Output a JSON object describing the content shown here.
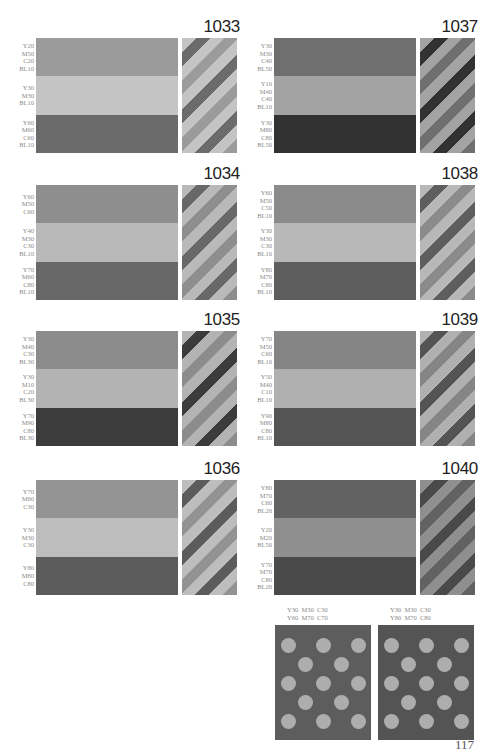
{
  "swatches": [
    {
      "id": "1033",
      "bands": [
        {
          "label": [
            "Y20",
            "M50",
            "C20",
            "BL10"
          ],
          "color": "#9b9b9b"
        },
        {
          "label": [
            "Y30",
            "M30",
            "BL10"
          ],
          "color": "#c4c4c4"
        },
        {
          "label": [
            "Y60",
            "M60",
            "C60",
            "BL10"
          ],
          "color": "#6b6b6b"
        }
      ]
    },
    {
      "id": "1034",
      "bands": [
        {
          "label": [
            "Y60",
            "M50",
            "C60"
          ],
          "color": "#8e8e8e"
        },
        {
          "label": [
            "Y40",
            "M30",
            "C30",
            "BL10"
          ],
          "color": "#b9b9b9"
        },
        {
          "label": [
            "Y70",
            "M60",
            "C80",
            "BL10"
          ],
          "color": "#686868"
        }
      ]
    },
    {
      "id": "1035",
      "bands": [
        {
          "label": [
            "Y30",
            "M40",
            "C30",
            "BL30"
          ],
          "color": "#8c8c8c"
        },
        {
          "label": [
            "Y30",
            "M10",
            "C20",
            "BL30"
          ],
          "color": "#b3b3b3"
        },
        {
          "label": [
            "Y70",
            "M90",
            "C80",
            "BL30"
          ],
          "color": "#3c3c3c"
        }
      ]
    },
    {
      "id": "1036",
      "bands": [
        {
          "label": [
            "Y70",
            "M60",
            "C30"
          ],
          "color": "#939393"
        },
        {
          "label": [
            "Y30",
            "M30",
            "C30"
          ],
          "color": "#bdbdbd"
        },
        {
          "label": [
            "Y80",
            "M80",
            "C80"
          ],
          "color": "#5c5c5c"
        }
      ]
    },
    {
      "id": "1037",
      "bands": [
        {
          "label": [
            "Y30",
            "M30",
            "C40",
            "BL50"
          ],
          "color": "#6f6f6f"
        },
        {
          "label": [
            "Y10",
            "M40",
            "C40",
            "BL10"
          ],
          "color": "#a3a3a3"
        },
        {
          "label": [
            "Y30",
            "M80",
            "C80",
            "BL50"
          ],
          "color": "#323232"
        }
      ]
    },
    {
      "id": "1038",
      "bands": [
        {
          "label": [
            "Y60",
            "M50",
            "C50",
            "BL10"
          ],
          "color": "#8b8b8b"
        },
        {
          "label": [
            "Y30",
            "M30",
            "C30",
            "BL10"
          ],
          "color": "#b8b8b8"
        },
        {
          "label": [
            "Y80",
            "M70",
            "C80",
            "BL10"
          ],
          "color": "#5e5e5e"
        }
      ]
    },
    {
      "id": "1039",
      "bands": [
        {
          "label": [
            "Y70",
            "M50",
            "C60",
            "BL10"
          ],
          "color": "#858585"
        },
        {
          "label": [
            "Y50",
            "M40",
            "C10",
            "BL10"
          ],
          "color": "#b0b0b0"
        },
        {
          "label": [
            "Y90",
            "M80",
            "C80",
            "BL10"
          ],
          "color": "#545454"
        }
      ]
    },
    {
      "id": "1040",
      "bands": [
        {
          "label": [
            "Y80",
            "M70",
            "C60",
            "BL20"
          ],
          "color": "#626262"
        },
        {
          "label": [
            "Y20",
            "M20",
            "BL50"
          ],
          "color": "#8f8f8f"
        },
        {
          "label": [
            "Y70",
            "M70",
            "C80",
            "BL20"
          ],
          "color": "#4a4a4a"
        }
      ]
    }
  ],
  "dot_swatches": [
    {
      "label_lines": [
        "Y30  M30  C30",
        "Y60  M70  C70"
      ],
      "bg": "#5d5d5d",
      "dot": "#adadad"
    },
    {
      "label_lines": [
        "Y30  M30  C30",
        "Y80  M70  C80"
      ],
      "bg": "#545454",
      "dot": "#adadad"
    }
  ],
  "page_number": "117"
}
